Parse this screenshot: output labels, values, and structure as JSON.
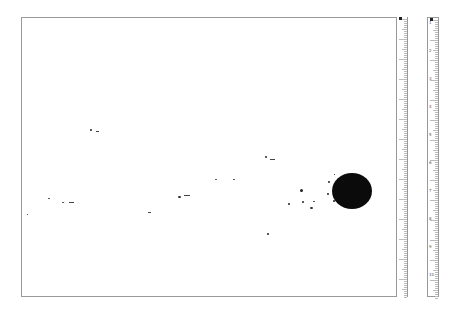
{
  "scan": {
    "description": "Scanned ink blot / droplet splatter on paper with measuring rulers",
    "background": "#ffffff",
    "ink_color": "#0b0b0b"
  },
  "frame": {
    "left": 21,
    "top": 17,
    "right": 396,
    "bottom": 297
  },
  "main_blot": {
    "cx": 352,
    "cy": 191,
    "rx": 20,
    "ry": 18
  },
  "droplets": [
    {
      "x": 90,
      "y": 129,
      "w": 2,
      "h": 2
    },
    {
      "x": 96,
      "y": 131,
      "w": 3,
      "h": 1
    },
    {
      "x": 48,
      "y": 198,
      "w": 2,
      "h": 1
    },
    {
      "x": 62,
      "y": 202,
      "w": 2,
      "h": 1
    },
    {
      "x": 69,
      "y": 202,
      "w": 5,
      "h": 1
    },
    {
      "x": 148,
      "y": 212,
      "w": 3,
      "h": 1
    },
    {
      "x": 178,
      "y": 196,
      "w": 3,
      "h": 2
    },
    {
      "x": 184,
      "y": 195,
      "w": 6,
      "h": 1
    },
    {
      "x": 215,
      "y": 179,
      "w": 2,
      "h": 1
    },
    {
      "x": 233,
      "y": 179,
      "w": 2,
      "h": 1
    },
    {
      "x": 265,
      "y": 156,
      "w": 2,
      "h": 2
    },
    {
      "x": 270,
      "y": 159,
      "w": 5,
      "h": 1
    },
    {
      "x": 300,
      "y": 189,
      "w": 3,
      "h": 3
    },
    {
      "x": 288,
      "y": 203,
      "w": 2,
      "h": 2
    },
    {
      "x": 302,
      "y": 201,
      "w": 2,
      "h": 2
    },
    {
      "x": 310,
      "y": 207,
      "w": 3,
      "h": 2
    },
    {
      "x": 313,
      "y": 201,
      "w": 2,
      "h": 1
    },
    {
      "x": 327,
      "y": 193,
      "w": 2,
      "h": 2
    },
    {
      "x": 328,
      "y": 181,
      "w": 2,
      "h": 2
    },
    {
      "x": 333,
      "y": 200,
      "w": 2,
      "h": 2
    },
    {
      "x": 267,
      "y": 233,
      "w": 2,
      "h": 2
    },
    {
      "x": 27,
      "y": 214,
      "w": 1,
      "h": 1
    },
    {
      "x": 334,
      "y": 174,
      "w": 1,
      "h": 1
    }
  ],
  "rulers": {
    "left": {
      "x": 396,
      "width": 12,
      "labels": [
        "",
        "",
        "",
        "",
        "",
        "",
        "",
        "",
        "",
        ""
      ]
    },
    "right": {
      "x": 427,
      "width": 12,
      "labels": [
        "1",
        "2",
        "3",
        "4",
        "5",
        "6",
        "7",
        "8",
        "9",
        "10"
      ]
    }
  }
}
